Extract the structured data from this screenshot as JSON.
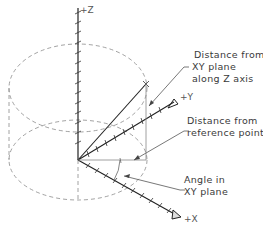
{
  "diagram": {
    "type": "cylindrical-coordinates",
    "axes": {
      "z_label": "+Z",
      "y_label": "+Y",
      "x_label": "+X"
    },
    "annotations": {
      "z_distance": [
        "Distance from",
        "XY plane",
        "along Z axis"
      ],
      "ref_distance": [
        "Distance from",
        "reference point"
      ],
      "angle": [
        "Angle in",
        "XY plane"
      ]
    },
    "colors": {
      "axis": "#222222",
      "dashed": "#8a8a8a",
      "leader": "#555555",
      "text": "#3a3a3a"
    }
  }
}
